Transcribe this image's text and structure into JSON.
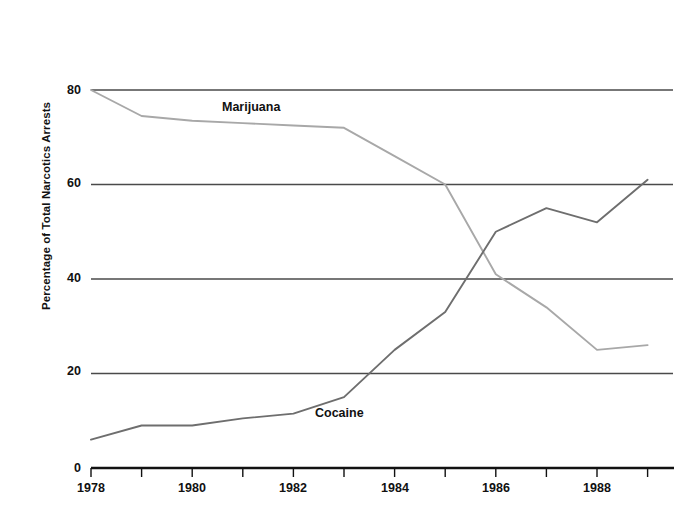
{
  "chart_data": {
    "type": "line",
    "title": "",
    "xlabel": "",
    "ylabel": "Percentage of Total Narcotics Arrests",
    "x": [
      1978,
      1979,
      1980,
      1981,
      1982,
      1983,
      1984,
      1985,
      1986,
      1987,
      1988,
      1989
    ],
    "xlim": [
      1978,
      1989.5
    ],
    "ylim": [
      0,
      80
    ],
    "xtick_labels": [
      "1978",
      "1980",
      "1982",
      "1984",
      "1986",
      "1988"
    ],
    "xtick_values": [
      1978,
      1980,
      1982,
      1984,
      1986,
      1988
    ],
    "xtick_all_values": [
      1978,
      1979,
      1980,
      1981,
      1982,
      1983,
      1984,
      1985,
      1986,
      1987,
      1988,
      1989
    ],
    "ytick_labels": [
      "0",
      "20",
      "40",
      "60",
      "80"
    ],
    "ytick_values": [
      0,
      20,
      40,
      60,
      80
    ],
    "grid": "horizontal",
    "legend_position": "inline-annotation",
    "series": [
      {
        "name": "Marijuana",
        "color": "#a8a8a8",
        "values": [
          80,
          74.5,
          73.5,
          73,
          72.5,
          72,
          66,
          60,
          41,
          34,
          25,
          26
        ],
        "annotation": "Marijuana"
      },
      {
        "name": "Cocaine",
        "color": "#6e6e6e",
        "values": [
          6,
          9,
          9,
          10.5,
          11.5,
          15,
          25,
          33,
          50,
          55,
          52,
          61
        ],
        "annotation": "Cocaine"
      }
    ],
    "annotations": [
      {
        "text": "Marijuana",
        "x_px": 222,
        "y_px": 101
      },
      {
        "text": "Cocaine",
        "x_px": 315,
        "y_px": 407
      }
    ],
    "axis_color": "#4a4a4a",
    "axis_baseline_color": "#111111",
    "background": "#ffffff"
  },
  "geometry": {
    "plot_left": 91,
    "plot_right": 673,
    "year_step_px": 50.6,
    "y_for_0": 468,
    "y_for_80": 90,
    "px_per_unit": 4.725
  }
}
